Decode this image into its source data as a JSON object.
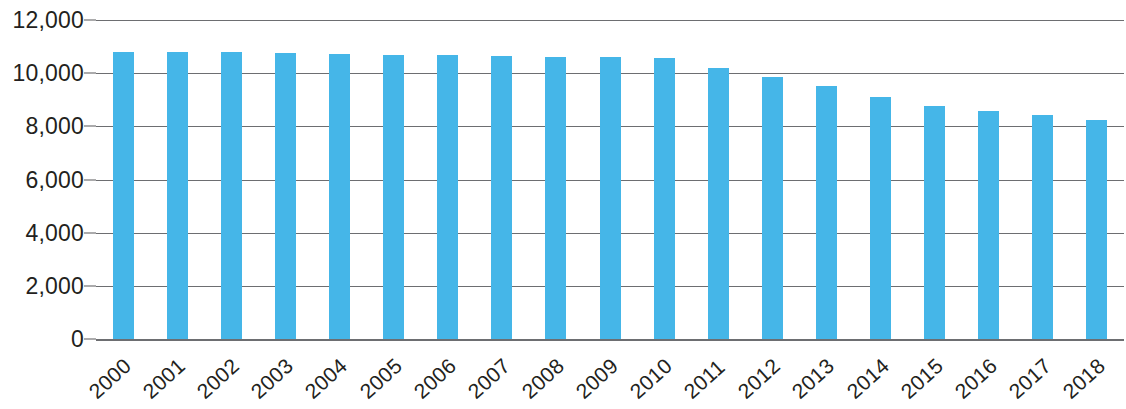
{
  "chart_data": {
    "type": "bar",
    "title": "",
    "subtitle": "",
    "xlabel": "",
    "ylabel": "",
    "categories": [
      "2000",
      "2001",
      "2002",
      "2003",
      "2004",
      "2005",
      "2006",
      "2007",
      "2008",
      "2009",
      "2010",
      "2011",
      "2012",
      "2013",
      "2014",
      "2015",
      "2016",
      "2017",
      "2018"
    ],
    "values": [
      10800,
      10790,
      10780,
      10760,
      10740,
      10700,
      10680,
      10660,
      10620,
      10600,
      10560,
      10200,
      9850,
      9500,
      9120,
      8760,
      8560,
      8440,
      8250
    ],
    "series": [
      {
        "name": "",
        "values": [
          10800,
          10790,
          10780,
          10760,
          10740,
          10700,
          10680,
          10660,
          10620,
          10600,
          10560,
          10200,
          9850,
          9500,
          9120,
          8760,
          8560,
          8440,
          8250
        ]
      }
    ],
    "ylim": [
      0,
      12000
    ],
    "y_ticks": [
      0,
      2000,
      4000,
      6000,
      8000,
      10000,
      12000
    ],
    "y_tick_labels": [
      "0",
      "2,000",
      "4,000",
      "6,000",
      "8,000",
      "10,000",
      "12,000"
    ],
    "grid": true,
    "legend": false,
    "legend_position": "none",
    "bar_color": "#45b6e8",
    "gridline_color": "#6d6e71",
    "text_color": "#231f20",
    "background_color": "#ffffff",
    "x_tick_rotation": -42
  }
}
